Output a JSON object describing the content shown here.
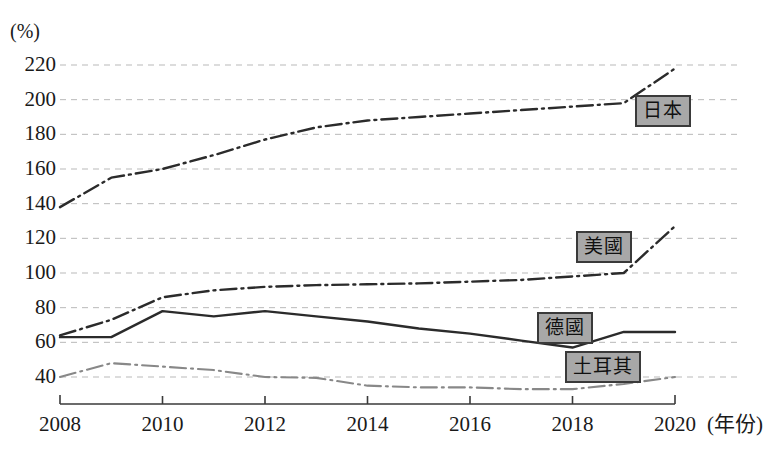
{
  "chart_data": {
    "type": "line",
    "title": "",
    "subtitle": "",
    "xlabel": "年份",
    "ylabel": "(%)",
    "grid": true,
    "legend_position": "inline-right",
    "xlim": [
      2008,
      2020
    ],
    "ylim": [
      30,
      228
    ],
    "x": [
      2008,
      2009,
      2010,
      2011,
      2012,
      2013,
      2014,
      2015,
      2016,
      2017,
      2018,
      2019,
      2020
    ],
    "xticks": [
      "2008",
      "2010",
      "2012",
      "2014",
      "2016",
      "2018",
      "2020"
    ],
    "yticks": [
      "40",
      "60",
      "80",
      "100",
      "120",
      "140",
      "160",
      "180",
      "200",
      "220"
    ],
    "series": [
      {
        "name": "日本",
        "style": "dash-dot",
        "color": "#2b2b2b",
        "values": [
          138,
          155,
          160,
          168,
          177,
          184,
          188,
          190,
          192,
          194,
          196,
          198,
          218
        ]
      },
      {
        "name": "美國",
        "style": "dash-dot",
        "color": "#2b2b2b",
        "values": [
          64,
          73,
          86,
          90,
          92,
          93,
          93.5,
          94,
          95,
          96,
          98,
          100,
          127
        ]
      },
      {
        "name": "德國",
        "style": "solid",
        "color": "#2b2b2b",
        "values": [
          63,
          63,
          78,
          75,
          78,
          75,
          72,
          68,
          65,
          61,
          57,
          66,
          66
        ]
      },
      {
        "name": "土耳其",
        "style": "dash-dot",
        "color": "#888888",
        "values": [
          40,
          48,
          46,
          44,
          40,
          39.5,
          35,
          34,
          34,
          33,
          33,
          36,
          40
        ]
      }
    ]
  },
  "axis": {
    "y_unit_label": "(%)",
    "x_unit_label": "(年份)"
  },
  "labels": {
    "japan": "日本",
    "usa": "美國",
    "germany": "德國",
    "turkey": "土耳其"
  }
}
